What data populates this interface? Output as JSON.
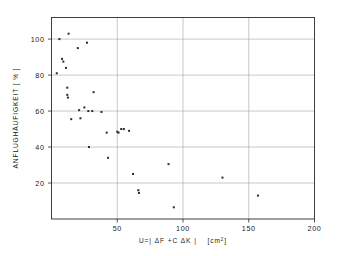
{
  "chart_data": {
    "type": "scatter",
    "title": "",
    "xlabel": "U=| ΔF +C ΔK |   [cm²]",
    "xlabel_main": "U=|  ΔF  +C  ΔK  |",
    "xlabel_unit": "[cm",
    "xlabel_unit_sup": "2",
    "xlabel_unit_close": "]",
    "ylabel": "ANFLUGHÄUFIGKEIT  [ % ]",
    "xlim": [
      0,
      200
    ],
    "ylim": [
      0,
      112
    ],
    "xticks": [
      50,
      100,
      150,
      200
    ],
    "yticks": [
      20,
      40,
      60,
      80,
      100
    ],
    "xtick_labels": [
      "50",
      "100",
      "150",
      "200"
    ],
    "ytick_labels": [
      "20",
      "40",
      "60",
      "80",
      "100"
    ],
    "grid": "both",
    "legend": "none",
    "marker": "square",
    "marker_size": 2,
    "point_color": "#2a2a2a",
    "frame_color": "#2b2b2b",
    "grid_color": "#9a9a9a",
    "points": [
      {
        "x": 4,
        "y": 81
      },
      {
        "x": 6,
        "y": 100
      },
      {
        "x": 8,
        "y": 89
      },
      {
        "x": 9,
        "y": 87.5
      },
      {
        "x": 11,
        "y": 84
      },
      {
        "x": 13,
        "y": 103
      },
      {
        "x": 12,
        "y": 73
      },
      {
        "x": 12,
        "y": 69
      },
      {
        "x": 12.5,
        "y": 67.5
      },
      {
        "x": 15,
        "y": 55.5
      },
      {
        "x": 20,
        "y": 95
      },
      {
        "x": 21,
        "y": 60.5
      },
      {
        "x": 22,
        "y": 56
      },
      {
        "x": 25,
        "y": 62
      },
      {
        "x": 27,
        "y": 98
      },
      {
        "x": 28,
        "y": 60
      },
      {
        "x": 28.5,
        "y": 40
      },
      {
        "x": 31,
        "y": 60
      },
      {
        "x": 32,
        "y": 70.5
      },
      {
        "x": 38,
        "y": 59.5
      },
      {
        "x": 42,
        "y": 48
      },
      {
        "x": 43,
        "y": 34
      },
      {
        "x": 50,
        "y": 48.5
      },
      {
        "x": 51,
        "y": 48
      },
      {
        "x": 53,
        "y": 50
      },
      {
        "x": 55,
        "y": 50
      },
      {
        "x": 59,
        "y": 49
      },
      {
        "x": 62,
        "y": 25
      },
      {
        "x": 66,
        "y": 16
      },
      {
        "x": 66.5,
        "y": 14.5
      },
      {
        "x": 89,
        "y": 30.5
      },
      {
        "x": 93,
        "y": 6.5
      },
      {
        "x": 130,
        "y": 23
      },
      {
        "x": 157,
        "y": 13
      }
    ]
  }
}
